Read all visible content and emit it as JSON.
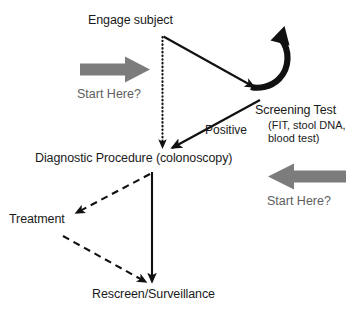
{
  "diagram": {
    "colors": {
      "ink": "#1a1a1a",
      "gray_arrow": "#7c7c7c",
      "cta_text": "#5e5e5e",
      "background": "#ffffff"
    },
    "nodes": [
      {
        "id": "engage-subject",
        "label": "Engage subject"
      },
      {
        "id": "screening-test",
        "label": "Screening Test"
      },
      {
        "id": "screening-detail",
        "line1": "(FIT, stool DNA,",
        "line2": "blood test)"
      },
      {
        "id": "diagnostic",
        "label": "Diagnostic Procedure (colonoscopy)"
      },
      {
        "id": "treatment",
        "label": "Treatment"
      },
      {
        "id": "rescreen",
        "label": "Rescreen/Surveillance"
      }
    ],
    "edge_labels": [
      {
        "id": "positive",
        "label": "Positive"
      }
    ],
    "callouts": [
      {
        "id": "start-here-left",
        "label": "Start Here?",
        "arrow": "block-arrow-right"
      },
      {
        "id": "start-here-right",
        "label": "Start Here?",
        "arrow": "block-arrow-left"
      }
    ],
    "edges": [
      {
        "id": "engage-to-screening",
        "style": "solid",
        "from": "engage-subject",
        "to": "screening-test"
      },
      {
        "id": "engage-to-diagnostic",
        "style": "dotted",
        "from": "engage-subject",
        "to": "diagnostic"
      },
      {
        "id": "screening-to-diagnostic",
        "style": "solid",
        "from": "screening-test",
        "to": "diagnostic",
        "label": "Positive"
      },
      {
        "id": "screening-loop",
        "style": "curved",
        "from": "screening-test",
        "to": "screening-test"
      },
      {
        "id": "diagnostic-to-rescreen",
        "style": "solid",
        "from": "diagnostic",
        "to": "rescreen"
      },
      {
        "id": "diagnostic-to-treatment",
        "style": "dashed",
        "from": "diagnostic",
        "to": "treatment"
      },
      {
        "id": "treatment-to-rescreen",
        "style": "dashed",
        "from": "treatment",
        "to": "rescreen"
      }
    ]
  }
}
